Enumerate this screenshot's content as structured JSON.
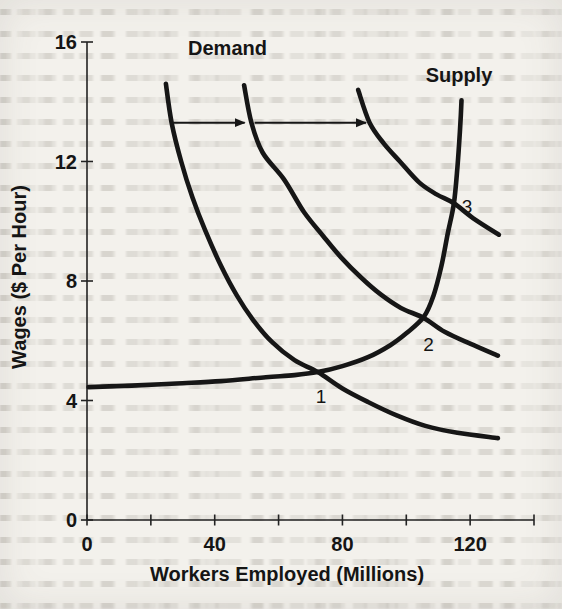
{
  "chart_data": {
    "type": "line",
    "title": "",
    "xlabel": "Workers Employed (Millions)",
    "ylabel": "Wages ($ Per Hour)",
    "xlim": [
      0,
      140
    ],
    "ylim": [
      0,
      16
    ],
    "x_ticks": [
      0,
      20,
      40,
      60,
      80,
      100,
      120,
      140
    ],
    "x_tick_labels": [
      "0",
      "",
      "40",
      "",
      "80",
      "",
      "120",
      ""
    ],
    "y_ticks": [
      0,
      4,
      8,
      12,
      16
    ],
    "y_tick_labels": [
      "0",
      "4",
      "8",
      "12",
      "16"
    ],
    "grid": false,
    "legend": false,
    "line_color": "#161616",
    "axis_color": "#222222",
    "series": [
      {
        "name": "Supply",
        "points": [
          [
            0.5,
            4.45
          ],
          [
            14,
            4.5
          ],
          [
            28,
            4.57
          ],
          [
            42,
            4.65
          ],
          [
            56,
            4.78
          ],
          [
            65,
            4.85
          ],
          [
            72.3,
            4.95
          ],
          [
            80,
            5.15
          ],
          [
            88,
            5.45
          ],
          [
            95,
            5.85
          ],
          [
            100,
            6.25
          ],
          [
            105.5,
            6.8
          ],
          [
            108.5,
            7.5
          ],
          [
            111,
            8.5
          ],
          [
            113,
            9.6
          ],
          [
            114.9,
            10.6
          ],
          [
            116,
            11.8
          ],
          [
            116.8,
            13.0
          ],
          [
            117.3,
            14.05
          ]
        ]
      },
      {
        "name": "Demand (original)",
        "points": [
          [
            24.7,
            14.6
          ],
          [
            26.5,
            13.3
          ],
          [
            29.5,
            12.0
          ],
          [
            33,
            10.8
          ],
          [
            37,
            9.7
          ],
          [
            42,
            8.5
          ],
          [
            47,
            7.5
          ],
          [
            52,
            6.7
          ],
          [
            58,
            5.95
          ],
          [
            65,
            5.35
          ],
          [
            72.3,
            4.95
          ],
          [
            80,
            4.4
          ],
          [
            88,
            3.95
          ],
          [
            97,
            3.5
          ],
          [
            106,
            3.15
          ],
          [
            116,
            2.92
          ],
          [
            128.7,
            2.74
          ]
        ]
      },
      {
        "name": "Demand (first shift right)",
        "points": [
          [
            49.2,
            14.55
          ],
          [
            51.5,
            13.3
          ],
          [
            55,
            12.3
          ],
          [
            61.7,
            11.4
          ],
          [
            68,
            10.3
          ],
          [
            74,
            9.5
          ],
          [
            79.5,
            8.8
          ],
          [
            86,
            8.1
          ],
          [
            92,
            7.55
          ],
          [
            98.3,
            7.1
          ],
          [
            105.5,
            6.76
          ],
          [
            112,
            6.3
          ],
          [
            120,
            5.9
          ],
          [
            128.7,
            5.5
          ]
        ]
      },
      {
        "name": "Demand (second shift right)",
        "points": [
          [
            84.9,
            14.4
          ],
          [
            88.5,
            13.3
          ],
          [
            93,
            12.6
          ],
          [
            98,
            12.0
          ],
          [
            104,
            11.3
          ],
          [
            109.5,
            10.9
          ],
          [
            114.9,
            10.6
          ],
          [
            121,
            10.1
          ],
          [
            129,
            9.55
          ]
        ]
      }
    ],
    "curve_labels": [
      {
        "text": "Demand",
        "x": 44,
        "y": 15.8
      },
      {
        "text": "Supply",
        "x": 116.5,
        "y": 14.9
      }
    ],
    "equilibrium_points": [
      {
        "label": "1",
        "x": 73.3,
        "y": 4.15
      },
      {
        "label": "2",
        "x": 107.0,
        "y": 5.9
      },
      {
        "label": "3",
        "x": 119.0,
        "y": 10.5
      }
    ],
    "shift_arrows": [
      {
        "from_x": 27,
        "to_x": 50,
        "y": 13.3
      },
      {
        "from_x": 52.5,
        "to_x": 88,
        "y": 13.3
      }
    ]
  }
}
